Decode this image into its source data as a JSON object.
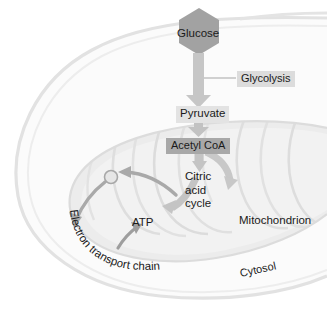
{
  "diagram": {
    "labels": {
      "glucose": "Glucose",
      "glycolysis": "Glycolysis",
      "pyruvate": "Pyruvate",
      "acetyl_coa": "Acetyl CoA",
      "citric_acid_cycle_line1": "Citric",
      "citric_acid_cycle_line2": "acid",
      "citric_acid_cycle_line3": "cycle",
      "atp": "ATP",
      "electron_transport_chain": "Electron transport chain",
      "mitochondrion": "Mitochondrion",
      "cytosol": "Cytosol"
    },
    "colors": {
      "background": "#ffffff",
      "cell_membrane": "#e0e0e0",
      "cytosol_fill": "#fbfbfb",
      "mitochondrion_outer": "#e8e8e8",
      "mitochondrion_matrix": "#eeeeee",
      "cristae": "#dedede",
      "arrow_gray": "#bdbdbd",
      "arrow_dark": "#9a9a9a",
      "glucose_fill": "#a0a0a0",
      "acetyl_coa_fill": "#a8a8a8",
      "label_box_fill": "#dcdcdc",
      "text": "#1a1a1a"
    },
    "shapes": {
      "glucose_marker": "hexagon",
      "etc_node": "circle",
      "flow_arrows": [
        "glucose-to-pyruvate",
        "pyruvate-to-acetyl-coa",
        "acetyl-coa-to-citric-acid-cycle",
        "citric-acid-cycle-to-etc-node",
        "etc-node-to-electron-transport-chain",
        "electron-transport-chain-to-atp"
      ],
      "connector_lines": [
        "glycolysis-leader-line"
      ]
    }
  }
}
